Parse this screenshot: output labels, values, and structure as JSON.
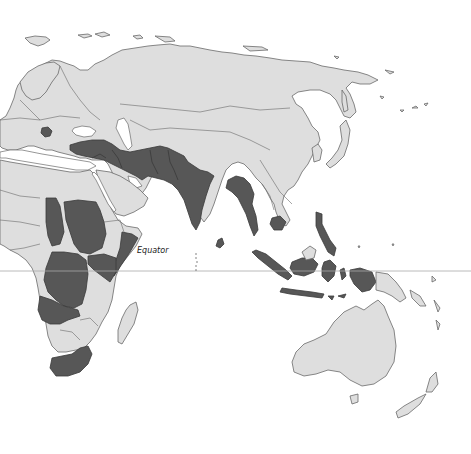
{
  "map": {
    "type": "choropleth",
    "projection": "world map (Eastern hemisphere crop: Europe, Africa, Asia, Oceania)",
    "colors": {
      "background": "#ffffff",
      "land_default": "#dedede",
      "land_highlighted": "#575757",
      "border": "#6a6a6a",
      "equator_line": "#a8a8a8"
    },
    "labels": {
      "equator": "Equator"
    },
    "highlighted_regions": [
      "Serbia/Balkans",
      "Turkey",
      "Syria",
      "Iraq",
      "Iran",
      "Afghanistan",
      "Pakistan",
      "India",
      "Sri Lanka",
      "Nepal",
      "Bangladesh",
      "Myanmar",
      "Cambodia",
      "Philippines",
      "Indonesia",
      "Papua (Indonesia)",
      "Chad",
      "Sudan",
      "Somalia",
      "Kenya",
      "Uganda",
      "Democratic Republic of the Congo",
      "Angola",
      "Zambia",
      "South Africa",
      "Republic of the Congo"
    ]
  }
}
